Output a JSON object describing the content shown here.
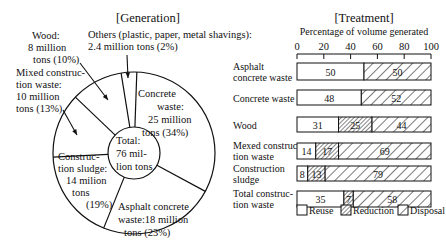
{
  "chart_data": [
    {
      "type": "pie",
      "title": "[Generation]",
      "center_label": [
        "Total:",
        "76 mil-",
        "lion tons"
      ],
      "total": "76 million tons",
      "slices": [
        {
          "label": "Concrete waste",
          "value_million_tons": 25,
          "percent": 34,
          "text": [
            "Concrete",
            "waste:",
            "25 million",
            "tons (34%)"
          ]
        },
        {
          "label": "Asphalt concrete waste",
          "value_million_tons": 18,
          "percent": 23,
          "text": [
            "Asphalt concrete",
            "waste:18 million",
            "tons (23%)"
          ]
        },
        {
          "label": "Construction sludge",
          "value_million_tons": 14,
          "percent": 19,
          "text": [
            "Construc-",
            "tion sludge:",
            "14 milion",
            "tons",
            "(19%)"
          ]
        },
        {
          "label": "Mixed construction waste",
          "value_million_tons": 10,
          "percent": 13,
          "text": [
            "Mixed construc-",
            "tion waste:",
            "10 million",
            "tons (13%)"
          ]
        },
        {
          "label": "Wood",
          "value_million_tons": 8,
          "percent": 10,
          "text": [
            "Wood:",
            "8 million",
            "tons (10%)"
          ]
        },
        {
          "label": "Others (plastic, paper, metal shavings)",
          "value_million_tons": 2.4,
          "percent": 2,
          "text": [
            "Others (plastic, paper, metal shavings):",
            "2.4 million tons (2%)"
          ]
        }
      ]
    },
    {
      "type": "bar",
      "orientation": "horizontal-stacked",
      "title": "[Treatment]",
      "xlabel": "Percentage of volume generated",
      "xlim": [
        0,
        100
      ],
      "xticks": [
        0,
        20,
        40,
        60,
        80,
        100
      ],
      "categories": [
        [
          "Asphalt",
          "concrete waste"
        ],
        [
          "Concrete waste"
        ],
        [
          "Wood"
        ],
        [
          "Mexed construc-",
          "tion waste"
        ],
        [
          "Construction",
          "sludge"
        ],
        [
          "Total construc-",
          "tion waste"
        ]
      ],
      "series": [
        {
          "name": "Reuse",
          "values": [
            50,
            48,
            31,
            14,
            8,
            35
          ]
        },
        {
          "name": "Reduction",
          "values": [
            0,
            0,
            25,
            17,
            13,
            7
          ]
        },
        {
          "name": "Disposal",
          "values": [
            50,
            52,
            44,
            69,
            79,
            58
          ]
        }
      ],
      "legend": [
        "Reuse",
        "Reduction",
        "Disposal"
      ],
      "legend_position": "bottom"
    }
  ]
}
